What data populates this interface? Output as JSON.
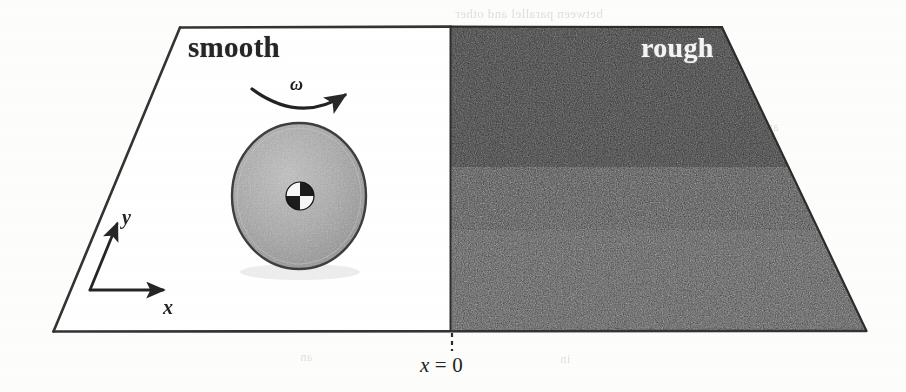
{
  "figure": {
    "background_color": "#fdfdfc",
    "regions": {
      "smooth": {
        "label": "smooth",
        "fill": "#ffffff",
        "text_color": "#262626"
      },
      "rough": {
        "label": "rough",
        "fill": "#3a3a3a",
        "text_color": "#f4f4f2"
      }
    },
    "boundary": {
      "label_x": "x",
      "label_eq": "=",
      "label_value": "0",
      "full_label": "x = 0",
      "line_style": "dashed"
    },
    "axes": {
      "x_label": "x",
      "y_label": "y",
      "origin_note": "lower-left of smooth region"
    },
    "disk": {
      "angular_velocity_symbol": "ω",
      "fill": "#a8a8a8",
      "edge_color": "#3f3f3f",
      "hub_marker": "center-of-mass-symbol"
    },
    "outline_color": "#343434"
  },
  "bleed_through": [
    {
      "text": "between parallel and other",
      "x": 455,
      "y": 6,
      "size": 13
    },
    {
      "text": "and",
      "x": 760,
      "y": 120,
      "size": 12
    },
    {
      "text": "on",
      "x": 228,
      "y": 173,
      "size": 12
    },
    {
      "text": "to",
      "x": 420,
      "y": 146,
      "size": 12
    },
    {
      "text": "the",
      "x": 560,
      "y": 160,
      "size": 12
    },
    {
      "text": "din",
      "x": 240,
      "y": 210,
      "size": 12
    },
    {
      "text": "cm",
      "x": 268,
      "y": 281,
      "size": 12
    },
    {
      "text": "line sample",
      "x": 233,
      "y": 303,
      "size": 12
    },
    {
      "text": "an",
      "x": 300,
      "y": 350,
      "size": 12
    },
    {
      "text": "in",
      "x": 560,
      "y": 352,
      "size": 12
    },
    {
      "text": "to",
      "x": 452,
      "y": 182,
      "size": 12
    }
  ]
}
